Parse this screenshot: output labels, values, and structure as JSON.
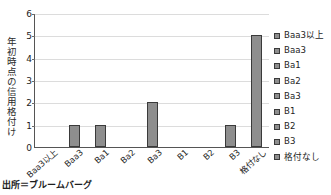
{
  "chart_data": {
    "type": "bar",
    "title": "",
    "xlabel": "",
    "ylabel": "年初時点の信用格付け",
    "ylim": [
      0,
      6
    ],
    "yticks": [
      0,
      1,
      2,
      3,
      4,
      5,
      6
    ],
    "grid": true,
    "legend_position": "right",
    "categories": [
      "Baa3以上",
      "Baa3",
      "Ba1",
      "Ba2",
      "Ba3",
      "B1",
      "B2",
      "B3",
      "格付なし"
    ],
    "values": [
      0,
      1,
      1,
      0,
      2,
      0,
      0,
      1,
      5
    ],
    "series": [
      {
        "name": "件数",
        "values": [
          0,
          1,
          1,
          0,
          2,
          0,
          0,
          1,
          5
        ]
      }
    ],
    "legend": [
      "Baa3以上",
      "Baa3",
      "Ba1",
      "Ba2",
      "Ba3",
      "B1",
      "B2",
      "B3",
      "格付なし"
    ],
    "colors": {
      "bar_fill": "#8e8e8e",
      "bar_border": "#3a3a3a",
      "gridline": "#dcdcdc",
      "axis": "#555555",
      "text": "#1d1d1d",
      "background": "#ffffff"
    },
    "annotations": {
      "source": "出所＝ブルームバーグ"
    }
  }
}
